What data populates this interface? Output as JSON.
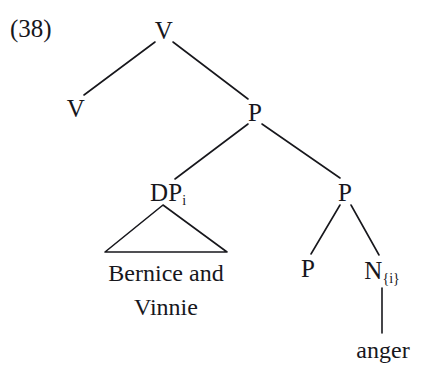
{
  "figure": {
    "example_number": "(38)",
    "kind": "syntax-tree",
    "ink_color": "#17171c",
    "background_color": "#ffffff"
  },
  "nodes": {
    "root_v": {
      "label": "V",
      "x": 164,
      "y": 30
    },
    "left_v": {
      "label": "V",
      "x": 76,
      "y": 108
    },
    "upper_p": {
      "label": "P",
      "x": 255,
      "y": 112
    },
    "dp": {
      "label": "DP",
      "subscript": "i",
      "x": 168,
      "y": 192
    },
    "lower_p": {
      "label": "P",
      "x": 345,
      "y": 192
    },
    "inner_p": {
      "label": "P",
      "x": 308,
      "y": 268
    },
    "n_node": {
      "label": "N",
      "subscript": "{i}",
      "x": 382,
      "y": 270
    }
  },
  "terminals": {
    "dp_phrase": {
      "line1": "Bernice and",
      "line2": "Vinnie",
      "x": 166,
      "y": 256
    },
    "anger": {
      "label": "anger",
      "x": 383,
      "y": 350
    }
  },
  "edges": [
    {
      "name": "root-v-to-left-v",
      "x1": 155,
      "y1": 42,
      "x2": 84,
      "y2": 95
    },
    {
      "name": "root-v-to-upper-p",
      "x1": 173,
      "y1": 42,
      "x2": 248,
      "y2": 99
    },
    {
      "name": "upper-p-to-dp",
      "x1": 248,
      "y1": 124,
      "x2": 175,
      "y2": 179
    },
    {
      "name": "upper-p-to-lower-p",
      "x1": 262,
      "y1": 124,
      "x2": 340,
      "y2": 178
    },
    {
      "name": "lower-p-to-inner-p",
      "x1": 340,
      "y1": 205,
      "x2": 311,
      "y2": 254
    },
    {
      "name": "lower-p-to-n",
      "x1": 351,
      "y1": 205,
      "x2": 379,
      "y2": 255
    },
    {
      "name": "n-to-anger",
      "x1": 382,
      "y1": 288,
      "x2": 382,
      "y2": 333
    }
  ],
  "triangle": {
    "name": "dp-expansion-triangle",
    "apex_x": 163,
    "apex_y": 205,
    "base_left_x": 105,
    "base_right_x": 227,
    "base_y": 252
  }
}
